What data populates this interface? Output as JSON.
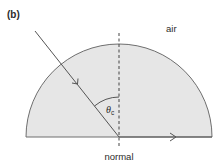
{
  "figure": {
    "panel_label": "(b)",
    "medium_outside_label": "air",
    "normal_label": "normal",
    "angle_symbol": "θ",
    "angle_subscript": "c",
    "colors": {
      "glass_fill": "#e6e6e6",
      "outline": "#6e6e6e",
      "ray": "#555555",
      "text": "#2b2b2b",
      "background": "#ffffff"
    }
  }
}
